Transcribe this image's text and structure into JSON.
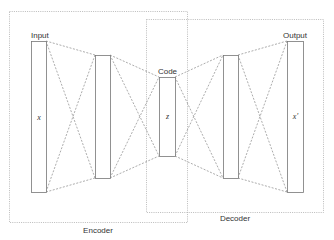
{
  "diagram": {
    "groups": [
      {
        "name": "encoder",
        "label": "Encoder"
      },
      {
        "name": "decoder",
        "label": "Decoder"
      }
    ],
    "layers": [
      {
        "name": "input",
        "label": "Input",
        "variable": "x"
      },
      {
        "name": "encoder-hidden",
        "label": "",
        "variable": ""
      },
      {
        "name": "code",
        "label": "Code",
        "variable": "z"
      },
      {
        "name": "decoder-hidden",
        "label": "",
        "variable": ""
      },
      {
        "name": "output",
        "label": "Output",
        "variable": "x'"
      }
    ],
    "colors": {
      "stroke": "#777777",
      "dashed": "#888888",
      "dotted": "#aaaaaa",
      "text": "#333333"
    }
  }
}
